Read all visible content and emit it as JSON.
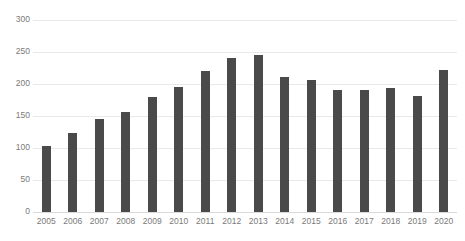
{
  "chart_data": {
    "type": "bar",
    "title": "",
    "subtitle": "",
    "xlabel": "",
    "ylabel": "",
    "categories": [
      "2005",
      "2006",
      "2007",
      "2008",
      "2009",
      "2010",
      "2011",
      "2012",
      "2013",
      "2014",
      "2015",
      "2016",
      "2017",
      "2018",
      "2019",
      "2020"
    ],
    "values": [
      103,
      123,
      146,
      157,
      179,
      195,
      220,
      240,
      246,
      211,
      206,
      191,
      191,
      193,
      182,
      222
    ],
    "series": [
      {
        "name": "",
        "values": [
          103,
          123,
          146,
          157,
          179,
          195,
          220,
          240,
          246,
          211,
          206,
          191,
          191,
          193,
          182,
          222
        ]
      }
    ],
    "ylim": [
      0,
      300
    ],
    "yticks": [
      0,
      50,
      100,
      150,
      200,
      250,
      300
    ],
    "ytick_labels": [
      "0",
      "50",
      "100",
      "150",
      "200",
      "250",
      "300"
    ],
    "xtick_labels": [
      "2005",
      "2006",
      "2007",
      "2008",
      "2009",
      "2010",
      "2011",
      "2012",
      "2013",
      "2014",
      "2015",
      "2016",
      "2017",
      "2018",
      "2019",
      "2020"
    ],
    "grid": true,
    "grid_axis": "y",
    "legend": false,
    "legend_position": "none",
    "bar_color": "#4a4a4a",
    "grid_color": "#e9e9e9",
    "axis_label_color": "#7a7a7a",
    "background_color": "#ffffff"
  }
}
